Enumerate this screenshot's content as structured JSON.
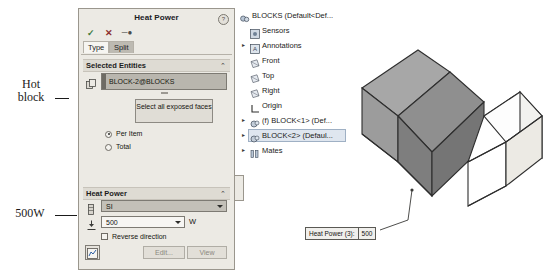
{
  "annotations": {
    "hot_block": "Hot\nblock",
    "hot_block_line1": "Hot",
    "hot_block_line2": "block",
    "power": "500W"
  },
  "panel": {
    "title": "Heat Power",
    "help_icon": "?",
    "commands": {
      "ok": "✓",
      "cancel": "✕",
      "pin": "─●"
    },
    "tabs": [
      {
        "label": "Type",
        "selected": true
      },
      {
        "label": "Split",
        "selected": false
      }
    ],
    "selected_entities": {
      "header": "Selected Entities",
      "collapse_chevron": "⌃",
      "entity": "BLOCK-2@BLOCKS",
      "exposed_button": "Select all exposed faces",
      "options": [
        {
          "label": "Per Item",
          "checked": true
        },
        {
          "label": "Total",
          "checked": false
        }
      ]
    },
    "heat_power": {
      "header": "Heat Power",
      "collapse_chevron": "⌃",
      "units_value": "SI",
      "value": "500",
      "unit_symbol": "W",
      "reverse_label": "Reverse direction",
      "reverse_checked": false,
      "edit_button": "Edit...",
      "view_button": "View"
    }
  },
  "tree": {
    "items": [
      {
        "label": "BLOCKS  (Default<Def...",
        "indent": 0,
        "expander": "",
        "icon": "assembly-icon",
        "selected": false
      },
      {
        "label": "Sensors",
        "indent": 1,
        "expander": "",
        "icon": "sensors-icon",
        "selected": false
      },
      {
        "label": "Annotations",
        "indent": 1,
        "expander": "▸",
        "icon": "annotations-icon",
        "selected": false
      },
      {
        "label": "Front",
        "indent": 1,
        "expander": "",
        "icon": "plane-icon",
        "selected": false
      },
      {
        "label": "Top",
        "indent": 1,
        "expander": "",
        "icon": "plane-icon",
        "selected": false
      },
      {
        "label": "Right",
        "indent": 1,
        "expander": "",
        "icon": "plane-icon",
        "selected": false
      },
      {
        "label": "Origin",
        "indent": 1,
        "expander": "",
        "icon": "origin-icon",
        "selected": false
      },
      {
        "label": "(f) BLOCK<1> (Def...",
        "indent": 1,
        "expander": "▸",
        "icon": "part-icon",
        "selected": false
      },
      {
        "label": "BLOCK<2> (Defaul...",
        "indent": 1,
        "expander": "▸",
        "icon": "part-icon",
        "selected": true
      },
      {
        "label": "Mates",
        "indent": 1,
        "expander": "▸",
        "icon": "mates-icon",
        "selected": false
      }
    ]
  },
  "viewport": {
    "callout": {
      "label": "Heat Power (3):",
      "value": "500"
    },
    "bodies": [
      {
        "name": "hot-block",
        "shaded": true,
        "fill": "#9b9b9b"
      },
      {
        "name": "cold-block",
        "shaded": false,
        "fill": "#ffffff"
      }
    ]
  },
  "colors": {
    "panel_bg": "#eceae4",
    "section_bg": "#dedbd3",
    "selection_blue": "#dfe6ef",
    "shaded_body": "#9b9b9b"
  }
}
